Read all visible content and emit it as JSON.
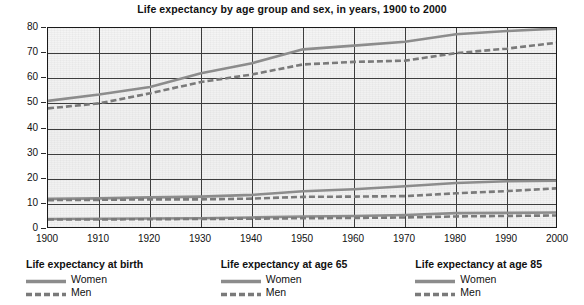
{
  "chart_data": {
    "type": "line",
    "title": "Life expectancy by age group and sex, in years, 1900 to 2000",
    "xlabel": "",
    "ylabel": "",
    "xlim": [
      1900,
      2000
    ],
    "ylim": [
      0,
      80
    ],
    "grid": true,
    "legend_position": "bottom",
    "x": [
      1900,
      1910,
      1920,
      1930,
      1940,
      1950,
      1960,
      1970,
      1980,
      1990,
      2000
    ],
    "x_ticks": [
      "1900",
      "1910",
      "1920",
      "1930",
      "1940",
      "1950",
      "1960",
      "1970",
      "1980",
      "1990",
      "2000"
    ],
    "y_ticks": [
      "0",
      "10",
      "20",
      "30",
      "40",
      "50",
      "60",
      "70",
      "80"
    ],
    "series": [
      {
        "name": "Life expectancy at birth - Women",
        "group": "Life expectancy at birth",
        "sex": "Women",
        "style": "solid",
        "values": [
          51.0,
          53.5,
          56.5,
          62.0,
          66.0,
          71.5,
          73.0,
          74.5,
          77.5,
          78.8,
          79.8
        ]
      },
      {
        "name": "Life expectancy at birth - Men",
        "group": "Life expectancy at birth",
        "sex": "Men",
        "style": "dashed",
        "values": [
          48.0,
          50.0,
          54.0,
          58.5,
          61.5,
          65.5,
          66.5,
          67.0,
          70.0,
          71.8,
          74.2
        ]
      },
      {
        "name": "Life expectancy at age 65 - Women",
        "group": "Life expectancy at age 65",
        "sex": "Women",
        "style": "solid",
        "values": [
          12.0,
          12.2,
          12.6,
          12.9,
          13.6,
          15.0,
          15.8,
          17.0,
          18.3,
          19.0,
          19.2
        ]
      },
      {
        "name": "Life expectancy at age 65 - Men",
        "group": "Life expectancy at age 65",
        "sex": "Men",
        "style": "dashed",
        "values": [
          11.5,
          11.6,
          11.8,
          11.8,
          12.1,
          12.8,
          12.9,
          13.1,
          14.2,
          15.1,
          16.2
        ]
      },
      {
        "name": "Life expectancy at age 85 - Women",
        "group": "Life expectancy at age 85",
        "sex": "Women",
        "style": "solid",
        "values": [
          4.0,
          4.1,
          4.2,
          4.3,
          4.6,
          5.0,
          5.2,
          5.6,
          6.3,
          6.4,
          6.6
        ]
      },
      {
        "name": "Life expectancy at age 85 - Men",
        "group": "Life expectancy at age 85",
        "sex": "Men",
        "style": "dashed",
        "values": [
          3.8,
          3.8,
          3.9,
          4.0,
          4.1,
          4.3,
          4.4,
          4.6,
          5.0,
          5.2,
          5.4
        ]
      }
    ],
    "colors": {
      "line": "#8c8c8c",
      "line_dark": "#7a7a7a",
      "axis": "#1a1a1a",
      "grid": "#3d3d3d",
      "plot_background": "#f2f2f2",
      "text": "#111111"
    }
  },
  "legend": {
    "groups": [
      {
        "title": "Life expectancy at birth",
        "entries": [
          {
            "label": "Women",
            "style": "solid"
          },
          {
            "label": "Men",
            "style": "dashed"
          }
        ]
      },
      {
        "title": "Life expectancy at age 65",
        "entries": [
          {
            "label": "Women",
            "style": "solid"
          },
          {
            "label": "Men",
            "style": "dashed"
          }
        ]
      },
      {
        "title": "Life expectancy at age 85",
        "entries": [
          {
            "label": "Women",
            "style": "solid"
          },
          {
            "label": "Men",
            "style": "dashed"
          }
        ]
      }
    ]
  }
}
